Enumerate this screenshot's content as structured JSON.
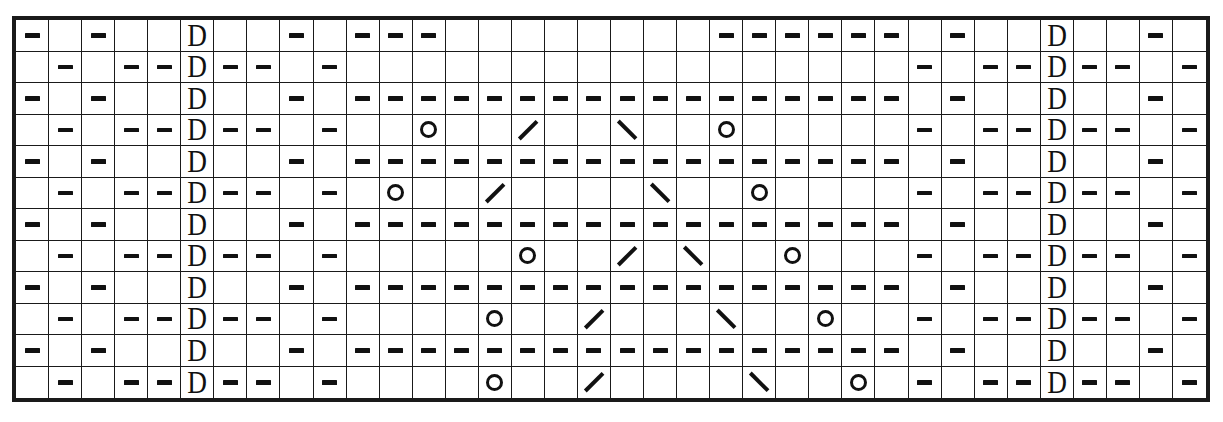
{
  "chart_data": {
    "type": "table",
    "title": "",
    "columns": 36,
    "rows": 12,
    "legend": [
      {
        "key": "dash",
        "symbol": "—",
        "label": "purl"
      },
      {
        "key": "dee",
        "symbol": "D",
        "label": "slip-stitch"
      },
      {
        "key": "circle",
        "symbol": "○",
        "label": "yarn-over"
      },
      {
        "key": "slash",
        "symbol": "/",
        "label": "right-leaning-decrease"
      },
      {
        "key": "backslash",
        "symbol": "\\",
        "label": "left-leaning-decrease"
      },
      {
        "key": "blank",
        "symbol": "",
        "label": "knit"
      }
    ],
    "colors": {
      "grid_line": "#1a1a1a",
      "border": "#1a1a1a",
      "symbol": "#111111",
      "cell_background": "#ffffff",
      "page_background": "#ffffff"
    },
    "cells": [
      [
        "dash",
        "blank",
        "dash",
        "blank",
        "blank",
        "dee",
        "blank",
        "blank",
        "dash",
        "blank",
        "dash",
        "dash",
        "dash",
        "blank",
        "blank",
        "blank",
        "blank",
        "blank",
        "blank",
        "blank",
        "blank",
        "dash",
        "dash",
        "dash",
        "dash",
        "dash",
        "dash",
        "blank",
        "dash",
        "blank",
        "blank",
        "dee",
        "blank",
        "blank",
        "dash",
        "blank"
      ],
      [
        "blank",
        "dash",
        "blank",
        "dash",
        "dash",
        "dee",
        "dash",
        "dash",
        "blank",
        "dash",
        "blank",
        "blank",
        "blank",
        "blank",
        "blank",
        "blank",
        "blank",
        "blank",
        "blank",
        "blank",
        "blank",
        "blank",
        "blank",
        "blank",
        "blank",
        "blank",
        "blank",
        "dash",
        "blank",
        "dash",
        "dash",
        "dee",
        "dash",
        "dash",
        "blank",
        "dash"
      ],
      [
        "dash",
        "blank",
        "dash",
        "blank",
        "blank",
        "dee",
        "blank",
        "blank",
        "dash",
        "blank",
        "dash",
        "dash",
        "dash",
        "dash",
        "dash",
        "dash",
        "dash",
        "dash",
        "dash",
        "dash",
        "dash",
        "dash",
        "dash",
        "dash",
        "dash",
        "dash",
        "dash",
        "blank",
        "dash",
        "blank",
        "blank",
        "dee",
        "blank",
        "blank",
        "dash",
        "blank"
      ],
      [
        "blank",
        "dash",
        "blank",
        "dash",
        "dash",
        "dee",
        "dash",
        "dash",
        "blank",
        "dash",
        "blank",
        "blank",
        "circle",
        "blank",
        "blank",
        "slash",
        "blank",
        "blank",
        "backslash",
        "blank",
        "blank",
        "circle",
        "blank",
        "blank",
        "blank",
        "blank",
        "blank",
        "dash",
        "blank",
        "dash",
        "dash",
        "dee",
        "dash",
        "dash",
        "blank",
        "dash"
      ],
      [
        "dash",
        "blank",
        "dash",
        "blank",
        "blank",
        "dee",
        "blank",
        "blank",
        "dash",
        "blank",
        "dash",
        "dash",
        "dash",
        "dash",
        "dash",
        "dash",
        "dash",
        "dash",
        "dash",
        "dash",
        "dash",
        "dash",
        "dash",
        "dash",
        "dash",
        "dash",
        "dash",
        "blank",
        "dash",
        "blank",
        "blank",
        "dee",
        "blank",
        "blank",
        "dash",
        "blank"
      ],
      [
        "blank",
        "dash",
        "blank",
        "dash",
        "dash",
        "dee",
        "dash",
        "dash",
        "blank",
        "dash",
        "blank",
        "circle",
        "blank",
        "blank",
        "slash",
        "blank",
        "blank",
        "blank",
        "blank",
        "backslash",
        "blank",
        "blank",
        "circle",
        "blank",
        "blank",
        "blank",
        "blank",
        "dash",
        "blank",
        "dash",
        "dash",
        "dee",
        "dash",
        "dash",
        "blank",
        "dash"
      ],
      [
        "dash",
        "blank",
        "dash",
        "blank",
        "blank",
        "dee",
        "blank",
        "blank",
        "dash",
        "blank",
        "dash",
        "dash",
        "dash",
        "dash",
        "dash",
        "dash",
        "dash",
        "dash",
        "dash",
        "dash",
        "dash",
        "dash",
        "dash",
        "dash",
        "dash",
        "dash",
        "dash",
        "blank",
        "dash",
        "blank",
        "blank",
        "dee",
        "blank",
        "blank",
        "dash",
        "blank"
      ],
      [
        "blank",
        "dash",
        "blank",
        "dash",
        "dash",
        "dee",
        "dash",
        "dash",
        "blank",
        "dash",
        "blank",
        "blank",
        "blank",
        "blank",
        "blank",
        "circle",
        "blank",
        "blank",
        "slash",
        "blank",
        "backslash",
        "blank",
        "blank",
        "circle",
        "blank",
        "blank",
        "blank",
        "dash",
        "blank",
        "dash",
        "dash",
        "dee",
        "dash",
        "dash",
        "blank",
        "dash"
      ],
      [
        "dash",
        "blank",
        "dash",
        "blank",
        "blank",
        "dee",
        "blank",
        "blank",
        "dash",
        "blank",
        "dash",
        "dash",
        "dash",
        "dash",
        "dash",
        "dash",
        "dash",
        "dash",
        "dash",
        "dash",
        "dash",
        "dash",
        "dash",
        "dash",
        "dash",
        "dash",
        "dash",
        "blank",
        "dash",
        "blank",
        "blank",
        "dee",
        "blank",
        "blank",
        "dash",
        "blank"
      ],
      [
        "blank",
        "dash",
        "blank",
        "dash",
        "dash",
        "dee",
        "dash",
        "dash",
        "blank",
        "dash",
        "blank",
        "blank",
        "blank",
        "blank",
        "circle",
        "blank",
        "blank",
        "slash",
        "blank",
        "blank",
        "blank",
        "backslash",
        "blank",
        "blank",
        "circle",
        "blank",
        "blank",
        "dash",
        "blank",
        "dash",
        "dash",
        "dee",
        "dash",
        "dash",
        "blank",
        "dash"
      ],
      [
        "dash",
        "blank",
        "dash",
        "blank",
        "blank",
        "dee",
        "blank",
        "blank",
        "dash",
        "blank",
        "dash",
        "dash",
        "dash",
        "dash",
        "dash",
        "dash",
        "dash",
        "dash",
        "dash",
        "dash",
        "dash",
        "dash",
        "dash",
        "dash",
        "dash",
        "dash",
        "dash",
        "blank",
        "dash",
        "blank",
        "blank",
        "dee",
        "blank",
        "blank",
        "dash",
        "blank"
      ],
      [
        "blank",
        "dash",
        "blank",
        "dash",
        "dash",
        "dee",
        "dash",
        "dash",
        "blank",
        "dash",
        "blank",
        "blank",
        "blank",
        "blank",
        "circle",
        "blank",
        "blank",
        "slash",
        "blank",
        "blank",
        "blank",
        "blank",
        "backslash",
        "blank",
        "blank",
        "circle",
        "blank",
        "dash",
        "blank",
        "dash",
        "dash",
        "dee",
        "dash",
        "dash",
        "blank",
        "dash"
      ]
    ]
  }
}
